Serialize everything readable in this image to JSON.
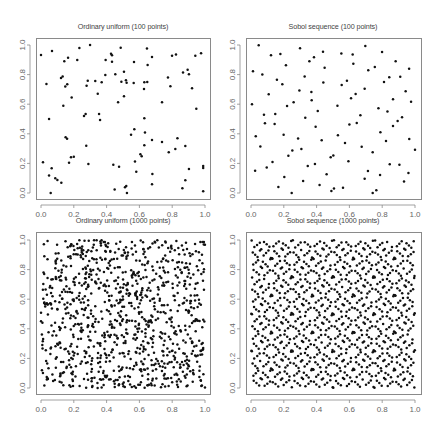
{
  "figure": {
    "width": 445,
    "height": 427,
    "point_color": "#111111",
    "frame_color": "#8a8a8a",
    "text_color": "#555555"
  },
  "chart_data": [
    {
      "type": "scatter",
      "title": "Ordinary uniform   (100 points)",
      "xlabel": "",
      "ylabel": "",
      "xlim": [
        0,
        1
      ],
      "ylim": [
        0,
        1
      ],
      "xticks": [
        "0.0",
        "0.2",
        "0.4",
        "0.6",
        "0.8",
        "1.0"
      ],
      "yticks": [
        "0.0",
        "0.2",
        "0.4",
        "0.6",
        "0.8",
        "1.0"
      ],
      "grid": false,
      "n_points": 100,
      "frame": {
        "left": 36,
        "top": 38,
        "right": 210,
        "bottom": 199,
        "x0": 41,
        "x1": 205,
        "y0": 193,
        "y1": 45
      },
      "points": [
        [
          0.0,
          0.932
        ],
        [
          0.067,
          0.959
        ],
        [
          0.234,
          0.98
        ],
        [
          0.299,
          1.0
        ],
        [
          0.142,
          0.89
        ],
        [
          0.165,
          0.914
        ],
        [
          0.221,
          0.898
        ],
        [
          0.427,
          0.941
        ],
        [
          0.433,
          0.93
        ],
        [
          0.486,
          0.982
        ],
        [
          0.646,
          0.977
        ],
        [
          0.677,
          0.919
        ],
        [
          0.799,
          0.928
        ],
        [
          0.823,
          0.935
        ],
        [
          0.941,
          0.928
        ],
        [
          0.976,
          0.944
        ],
        [
          0.394,
          0.898
        ],
        [
          0.433,
          0.887
        ],
        [
          0.567,
          0.885
        ],
        [
          0.65,
          0.865
        ],
        [
          0.506,
          0.82
        ],
        [
          0.866,
          0.815
        ],
        [
          0.894,
          0.833
        ],
        [
          0.902,
          0.802
        ],
        [
          0.122,
          0.777
        ],
        [
          0.132,
          0.788
        ],
        [
          0.392,
          0.797
        ],
        [
          0.453,
          0.802
        ],
        [
          0.774,
          0.781
        ],
        [
          0.033,
          0.736
        ],
        [
          0.148,
          0.72
        ],
        [
          0.16,
          0.734
        ],
        [
          0.285,
          0.759
        ],
        [
          0.278,
          0.725
        ],
        [
          0.331,
          0.757
        ],
        [
          0.37,
          0.748
        ],
        [
          0.49,
          0.752
        ],
        [
          0.518,
          0.761
        ],
        [
          0.522,
          0.745
        ],
        [
          0.565,
          0.743
        ],
        [
          0.63,
          0.748
        ],
        [
          0.628,
          0.703
        ],
        [
          0.648,
          0.75
        ],
        [
          0.789,
          0.721
        ],
        [
          0.921,
          0.707
        ],
        [
          0.346,
          0.671
        ],
        [
          0.506,
          0.653
        ],
        [
          0.187,
          0.646
        ],
        [
          0.47,
          0.613
        ],
        [
          0.738,
          0.613
        ],
        [
          0.136,
          0.59
        ],
        [
          0.947,
          0.57
        ],
        [
          0.262,
          0.52
        ],
        [
          0.272,
          0.534
        ],
        [
          0.354,
          0.534
        ],
        [
          0.36,
          0.493
        ],
        [
          0.049,
          0.5
        ],
        [
          0.63,
          0.505
        ],
        [
          0.569,
          0.43
        ],
        [
          0.549,
          0.394
        ],
        [
          0.634,
          0.408
        ],
        [
          0.15,
          0.376
        ],
        [
          0.159,
          0.367
        ],
        [
          0.677,
          0.358
        ],
        [
          0.738,
          0.345
        ],
        [
          0.832,
          0.37
        ],
        [
          0.276,
          0.32
        ],
        [
          0.63,
          0.322
        ],
        [
          0.779,
          0.275
        ],
        [
          0.819,
          0.297
        ],
        [
          0.88,
          0.318
        ],
        [
          0.606,
          0.261
        ],
        [
          0.614,
          0.248
        ],
        [
          0.183,
          0.241
        ],
        [
          0.171,
          0.205
        ],
        [
          0.012,
          0.207
        ],
        [
          0.289,
          0.196
        ],
        [
          0.441,
          0.191
        ],
        [
          0.476,
          0.178
        ],
        [
          0.573,
          0.212
        ],
        [
          0.581,
          0.144
        ],
        [
          0.065,
          0.167
        ],
        [
          0.049,
          0.119
        ],
        [
          0.087,
          0.099
        ],
        [
          0.1,
          0.088
        ],
        [
          0.124,
          0.07
        ],
        [
          0.679,
          0.128
        ],
        [
          0.677,
          0.059
        ],
        [
          0.902,
          0.162
        ],
        [
          0.88,
          0.086
        ],
        [
          0.989,
          0.182
        ],
        [
          0.989,
          0.169
        ],
        [
          0.449,
          0.023
        ],
        [
          0.512,
          0.039
        ],
        [
          0.52,
          0.048
        ],
        [
          0.524,
          0.0
        ],
        [
          0.862,
          0.032
        ],
        [
          0.989,
          0.011
        ],
        [
          0.059,
          0.0
        ],
        [
          0.2,
          0.245
        ]
      ]
    },
    {
      "type": "scatter",
      "title": "Sobol sequence   (100 points)",
      "xlabel": "",
      "ylabel": "",
      "xlim": [
        0,
        1
      ],
      "ylim": [
        0,
        1
      ],
      "xticks": [
        "0.0",
        "0.2",
        "0.4",
        "0.6",
        "0.8",
        "1.0"
      ],
      "yticks": [
        "0.0",
        "0.2",
        "0.4",
        "0.6",
        "0.8",
        "1.0"
      ],
      "grid": false,
      "n_points": 100,
      "frame": {
        "left": 246,
        "top": 38,
        "right": 421,
        "bottom": 199,
        "x0": 251,
        "x1": 415,
        "y0": 193,
        "y1": 45
      },
      "points": [
        [
          0.047,
          0.998
        ],
        [
          0.122,
          0.93
        ],
        [
          0.179,
          0.94
        ],
        [
          0.299,
          0.978
        ],
        [
          0.439,
          0.955
        ],
        [
          0.551,
          0.942
        ],
        [
          0.62,
          0.935
        ],
        [
          0.697,
          0.993
        ],
        [
          0.799,
          0.953
        ],
        [
          0.356,
          0.891
        ],
        [
          0.384,
          0.917
        ],
        [
          0.213,
          0.864
        ],
        [
          0.624,
          0.874
        ],
        [
          0.882,
          0.89
        ],
        [
          0.012,
          0.823
        ],
        [
          0.069,
          0.8
        ],
        [
          0.449,
          0.847
        ],
        [
          0.715,
          0.829
        ],
        [
          0.755,
          0.852
        ],
        [
          0.964,
          0.84
        ],
        [
          0.327,
          0.788
        ],
        [
          0.158,
          0.766
        ],
        [
          0.191,
          0.734
        ],
        [
          0.441,
          0.746
        ],
        [
          0.553,
          0.73
        ],
        [
          0.585,
          0.759
        ],
        [
          0.811,
          0.75
        ],
        [
          0.843,
          0.782
        ],
        [
          0.91,
          0.786
        ],
        [
          0.295,
          0.692
        ],
        [
          0.368,
          0.683
        ],
        [
          0.693,
          0.705
        ],
        [
          0.943,
          0.687
        ],
        [
          0.108,
          0.667
        ],
        [
          0.37,
          0.627
        ],
        [
          0.61,
          0.64
        ],
        [
          0.638,
          0.669
        ],
        [
          0.866,
          0.633
        ],
        [
          0.976,
          0.617
        ],
        [
          0.006,
          0.6
        ],
        [
          0.22,
          0.588
        ],
        [
          0.26,
          0.613
        ],
        [
          0.527,
          0.59
        ],
        [
          0.777,
          0.572
        ],
        [
          0.407,
          0.554
        ],
        [
          0.832,
          0.55
        ],
        [
          0.079,
          0.529
        ],
        [
          0.148,
          0.534
        ],
        [
          0.331,
          0.509
        ],
        [
          0.667,
          0.525
        ],
        [
          0.921,
          0.511
        ],
        [
          0.085,
          0.471
        ],
        [
          0.144,
          0.466
        ],
        [
          0.6,
          0.462
        ],
        [
          0.645,
          0.473
        ],
        [
          0.894,
          0.487
        ],
        [
          0.394,
          0.448
        ],
        [
          0.866,
          0.453
        ],
        [
          0.029,
          0.383
        ],
        [
          0.199,
          0.394
        ],
        [
          0.287,
          0.369
        ],
        [
          0.53,
          0.39
        ],
        [
          0.789,
          0.41
        ],
        [
          0.057,
          0.315
        ],
        [
          0.431,
          0.356
        ],
        [
          0.573,
          0.338
        ],
        [
          0.823,
          0.351
        ],
        [
          0.965,
          0.365
        ],
        [
          0.252,
          0.288
        ],
        [
          0.307,
          0.297
        ],
        [
          0.675,
          0.313
        ],
        [
          1.0,
          0.293
        ],
        [
          0.228,
          0.252
        ],
        [
          0.486,
          0.241
        ],
        [
          0.502,
          0.254
        ],
        [
          0.742,
          0.275
        ],
        [
          0.131,
          0.209
        ],
        [
          0.594,
          0.214
        ],
        [
          0.096,
          0.173
        ],
        [
          0.346,
          0.182
        ],
        [
          0.39,
          0.196
        ],
        [
          0.846,
          0.194
        ],
        [
          0.905,
          0.191
        ],
        [
          0.025,
          0.151
        ],
        [
          0.713,
          0.149
        ],
        [
          0.96,
          0.135
        ],
        [
          0.461,
          0.126
        ],
        [
          0.787,
          0.122
        ],
        [
          0.203,
          0.108
        ],
        [
          0.693,
          0.097
        ],
        [
          0.318,
          0.081
        ],
        [
          0.933,
          0.077
        ],
        [
          0.418,
          0.054
        ],
        [
          0.167,
          0.041
        ],
        [
          0.49,
          0.014
        ],
        [
          0.506,
          0.03
        ],
        [
          0.561,
          0.036
        ],
        [
          0.764,
          0.018
        ],
        [
          0.248,
          0.0
        ],
        [
          0.742,
          0.0
        ]
      ]
    },
    {
      "type": "scatter",
      "title": "Ordinary uniform   (1000 points)",
      "xlabel": "",
      "ylabel": "",
      "xlim": [
        0,
        1
      ],
      "ylim": [
        0,
        1
      ],
      "xticks": [
        "0.0",
        "0.2",
        "0.4",
        "0.6",
        "0.8",
        "1.0"
      ],
      "yticks": [
        "0.0",
        "0.2",
        "0.4",
        "0.6",
        "0.8",
        "1.0"
      ],
      "grid": false,
      "n_points": 1000,
      "frame": {
        "left": 36,
        "top": 232,
        "right": 210,
        "bottom": 394,
        "x0": 41,
        "x1": 205,
        "y0": 388,
        "y1": 240
      },
      "generator": {
        "kind": "uniform",
        "seed": 12345
      }
    },
    {
      "type": "scatter",
      "title": "Sobol sequence   (1000 points)",
      "xlabel": "",
      "ylabel": "",
      "xlim": [
        0,
        1
      ],
      "ylim": [
        0,
        1
      ],
      "xticks": [
        "0.0",
        "0.2",
        "0.4",
        "0.6",
        "0.8",
        "1.0"
      ],
      "yticks": [
        "0.0",
        "0.2",
        "0.4",
        "0.6",
        "0.8",
        "1.0"
      ],
      "grid": false,
      "n_points": 1000,
      "frame": {
        "left": 246,
        "top": 232,
        "right": 421,
        "bottom": 394,
        "x0": 251,
        "x1": 415,
        "y0": 388,
        "y1": 240
      },
      "generator": {
        "kind": "sobol",
        "dims": 2
      }
    }
  ]
}
